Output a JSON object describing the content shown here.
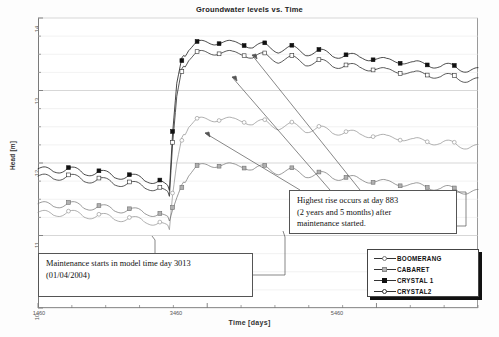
{
  "chart_data": {
    "type": "line",
    "title": "Groundwater levels vs. Time",
    "xlabel": "Time  [days]",
    "ylabel": "Head [m]",
    "xlim": [
      1460,
      6660
    ],
    "ylim": [
      10,
      14
    ],
    "xticks": [
      1460,
      3460,
      5460
    ],
    "yticks": [
      10,
      11,
      12,
      13,
      14
    ],
    "grid": true,
    "legend_position": "bottom-right",
    "x": [
      1460,
      1640,
      1820,
      2000,
      2180,
      2360,
      2540,
      2720,
      2900,
      3013,
      3050,
      3100,
      3160,
      3240,
      3340,
      3460,
      3600,
      3760,
      3896,
      4000,
      4140,
      4300,
      4460,
      4620,
      4780,
      4940,
      5100,
      5260,
      5420,
      5580,
      5740,
      5900,
      6060,
      6220,
      6380,
      6540,
      6660
    ],
    "series": [
      {
        "name": "BOOMERANG",
        "marker": "open-circle-grey",
        "values": [
          11.32,
          11.28,
          11.34,
          11.25,
          11.3,
          11.21,
          11.26,
          11.17,
          11.2,
          11.08,
          11.55,
          12.0,
          12.35,
          12.52,
          12.58,
          12.6,
          12.62,
          12.58,
          12.6,
          12.54,
          12.56,
          12.5,
          12.52,
          12.46,
          12.48,
          12.42,
          12.44,
          12.38,
          12.4,
          12.34,
          12.36,
          12.3,
          12.32,
          12.26,
          12.28,
          12.22,
          12.21
        ]
      },
      {
        "name": "CABARET",
        "marker": "grey-square",
        "values": [
          11.44,
          11.4,
          11.46,
          11.37,
          11.42,
          11.33,
          11.38,
          11.29,
          11.32,
          11.2,
          11.35,
          11.52,
          11.7,
          11.85,
          11.93,
          11.97,
          11.99,
          11.95,
          11.97,
          11.92,
          11.93,
          11.88,
          11.89,
          11.84,
          11.85,
          11.8,
          11.81,
          11.76,
          11.77,
          11.72,
          11.73,
          11.68,
          11.69,
          11.64,
          11.65,
          11.6,
          11.59
        ]
      },
      {
        "name": "CRYSTAL 1",
        "marker": "filled-square",
        "values": [
          11.92,
          11.88,
          11.94,
          11.84,
          11.9,
          11.79,
          11.85,
          11.74,
          11.78,
          11.62,
          12.4,
          13.1,
          13.45,
          13.58,
          13.64,
          13.66,
          13.68,
          13.64,
          13.66,
          13.6,
          13.62,
          13.56,
          13.58,
          13.52,
          13.54,
          13.48,
          13.5,
          13.44,
          13.46,
          13.4,
          13.42,
          13.36,
          13.38,
          13.32,
          13.34,
          13.28,
          13.27
        ]
      },
      {
        "name": "CRYSTAL2",
        "marker": "open-square",
        "values": [
          11.82,
          11.78,
          11.84,
          11.74,
          11.8,
          11.69,
          11.75,
          11.64,
          11.68,
          11.54,
          12.25,
          12.92,
          13.3,
          13.44,
          13.5,
          13.52,
          13.54,
          13.5,
          13.52,
          13.46,
          13.48,
          13.42,
          13.44,
          13.38,
          13.4,
          13.34,
          13.36,
          13.3,
          13.32,
          13.26,
          13.28,
          13.22,
          13.24,
          13.18,
          13.2,
          13.14,
          13.13
        ]
      }
    ],
    "annotations": [
      {
        "id": "maintenance",
        "lines": [
          "Maintenance starts in model time day 3013",
          "(01/04/2004)"
        ]
      },
      {
        "id": "highest-rise",
        "lines": [
          "Highest rise occurs at day 883",
          "(2 years and 5 months) after",
          "maintenance started."
        ]
      }
    ]
  },
  "legend": {
    "entries": [
      {
        "label": "BOOMERANG"
      },
      {
        "label": "CABARET"
      },
      {
        "label": "CRYSTAL 1"
      },
      {
        "label": "CRYSTAL2"
      }
    ]
  },
  "yticklabels": [
    "14",
    "13",
    "12",
    "11",
    "10"
  ],
  "xticklabels": [
    "1460",
    "3460",
    "5460"
  ]
}
